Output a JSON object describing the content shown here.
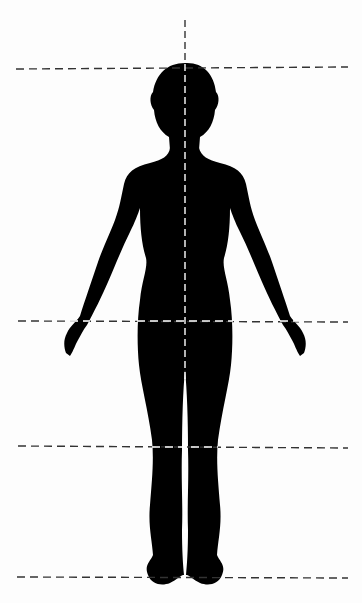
{
  "diagram": {
    "background_color": "#fdfdfd",
    "silhouette_color": "#000000",
    "guide_line_color_outside": "#333333",
    "guide_line_color_inside": "#ffffff",
    "horizontal_guides": [
      {
        "name": "top-of-head",
        "y": 68,
        "x1": 16,
        "x2": 348
      },
      {
        "name": "crotch-wrist",
        "y": 321,
        "x1": 18,
        "x2": 348
      },
      {
        "name": "knee",
        "y": 447,
        "x1": 18,
        "x2": 348
      },
      {
        "name": "sole",
        "y": 577,
        "x1": 17,
        "x2": 348
      }
    ],
    "vertical_guide": {
      "name": "center-line",
      "x": 185,
      "y1": 20,
      "y2": 580
    }
  }
}
